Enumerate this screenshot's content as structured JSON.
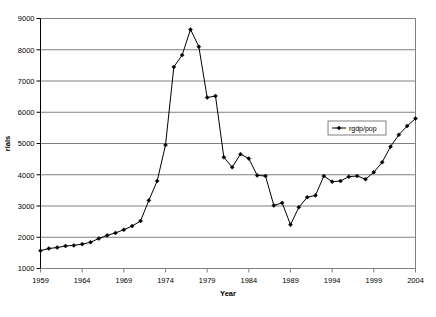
{
  "chart_data": {
    "type": "line",
    "title": "",
    "xlabel": "Year",
    "ylabel": "rials",
    "xlim": [
      1959,
      2004
    ],
    "ylim": [
      1000,
      9000
    ],
    "ytick_step": 1000,
    "xtick_step": 5,
    "grid": true,
    "grid_axis": "y",
    "legend_position": "inside-right",
    "legend": [
      "rgdp/pop"
    ],
    "marker": "diamond",
    "line_color": "#000000",
    "grid_color": "#808080",
    "plot_background": "#ffffff",
    "xticks": [
      1959,
      1964,
      1969,
      1974,
      1979,
      1984,
      1989,
      1994,
      1999,
      2004
    ],
    "yticks": [
      1000,
      2000,
      3000,
      4000,
      5000,
      6000,
      7000,
      8000,
      9000
    ],
    "series": [
      {
        "name": "rgdp/pop",
        "x": [
          1959,
          1960,
          1961,
          1962,
          1963,
          1964,
          1965,
          1966,
          1967,
          1968,
          1969,
          1970,
          1971,
          1972,
          1973,
          1974,
          1975,
          1976,
          1977,
          1978,
          1979,
          1980,
          1981,
          1982,
          1983,
          1984,
          1985,
          1986,
          1987,
          1988,
          1989,
          1990,
          1991,
          1992,
          1993,
          1994,
          1995,
          1996,
          1997,
          1998,
          1999,
          2000,
          2001,
          2002,
          2003,
          2004
        ],
        "values": [
          1570,
          1640,
          1670,
          1720,
          1740,
          1780,
          1840,
          1960,
          2060,
          2140,
          2240,
          2360,
          2520,
          3180,
          3800,
          4950,
          7450,
          7830,
          8650,
          8100,
          6470,
          6520,
          4560,
          4240,
          4660,
          4520,
          3980,
          3960,
          3020,
          3100,
          2400,
          2960,
          3280,
          3340,
          3960,
          3780,
          3800,
          3940,
          3960,
          3860,
          4080,
          4400,
          4900,
          5280,
          5560,
          5800
        ]
      }
    ]
  }
}
